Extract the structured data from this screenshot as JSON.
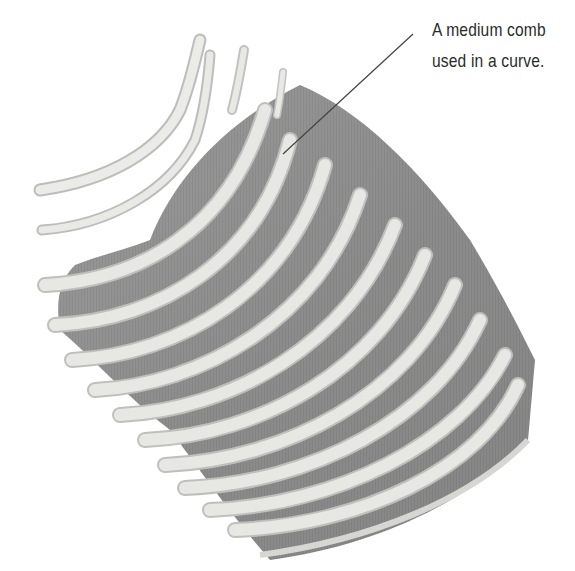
{
  "annotation": {
    "line1": "A medium comb",
    "line2": "used in a curve."
  },
  "image": {
    "subject": "curved comb",
    "colors": {
      "background": "#ffffff",
      "body": "#8f8f8f",
      "body_dark": "#7a7a7a",
      "teeth": "#e6e6e3",
      "teeth_edge": "#bdbdbd",
      "leader_line": "#444444"
    }
  }
}
